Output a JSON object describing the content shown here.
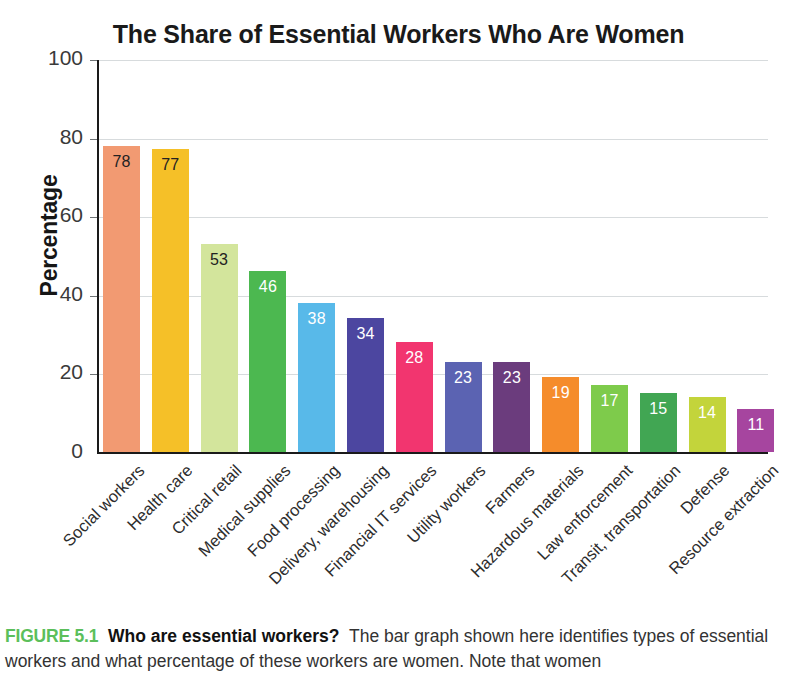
{
  "chart_data": {
    "type": "bar",
    "title": "The Share of Essential Workers Who Are Women",
    "xlabel": "",
    "ylabel": "Percentage",
    "ylim": [
      0,
      100
    ],
    "yticks": [
      0,
      20,
      40,
      60,
      80,
      100
    ],
    "grid": true,
    "legend": "none",
    "categories": [
      "Social workers",
      "Health care",
      "Critical retail",
      "Medical supplies",
      "Food processing",
      "Delivery, warehousing",
      "Financial IT services",
      "Utility workers",
      "Farmers",
      "Hazardous materials",
      "Law enforcement",
      "Transit, transportation",
      "Defense",
      "Resource extraction"
    ],
    "values": [
      78,
      77,
      53,
      46,
      38,
      34,
      28,
      23,
      23,
      19,
      17,
      15,
      14,
      11
    ],
    "bar_colors": [
      "#f29a72",
      "#f5c028",
      "#d3e59c",
      "#4cb850",
      "#58b9e9",
      "#4c46a0",
      "#f2356f",
      "#5b63b2",
      "#6b3c7d",
      "#f58c2b",
      "#7ecb4b",
      "#41a653",
      "#c3d43b",
      "#a6459f"
    ],
    "label_colors": [
      "#222222",
      "#222222",
      "#222222",
      "#ffffff",
      "#ffffff",
      "#ffffff",
      "#ffffff",
      "#ffffff",
      "#ffffff",
      "#ffffff",
      "#ffffff",
      "#ffffff",
      "#ffffff",
      "#ffffff"
    ]
  },
  "caption": {
    "figure_number": "FIGURE 5.1",
    "question": "Who are essential workers?",
    "body": "The bar graph shown here identifies types of essential workers and what percentage of these workers are women. Note that women"
  },
  "colors": {
    "axis": "#1a1a1a",
    "gridline": "#d7dbdd",
    "title": "#1a1a1a",
    "caption_accent": "#5bbf5b"
  }
}
